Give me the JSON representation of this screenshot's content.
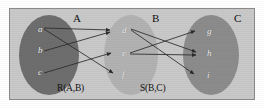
{
  "figure": {
    "background_color": "#ffffff",
    "panel_color": "#c9c9c9",
    "panel_border_color": "#8a8a8a",
    "edge_color": "#2b2b2b",
    "node_text_color": "#f2f2f2"
  },
  "sets": [
    {
      "id": "A",
      "label": "A",
      "fill": "#6e6e6e",
      "cx": 49,
      "cy": 55,
      "rx": 30,
      "ry": 40,
      "label_x": 73,
      "label_y": 12,
      "relation_label": "R(A,B)",
      "relation_label_x": 57,
      "relation_label_y": 83,
      "elements": [
        {
          "id": "a",
          "label": "a",
          "x": 38,
          "y": 29
        },
        {
          "id": "b",
          "label": "b",
          "x": 38,
          "y": 50
        },
        {
          "id": "c",
          "label": "c",
          "x": 38,
          "y": 72
        }
      ]
    },
    {
      "id": "B",
      "label": "B",
      "fill": "#b2b2b2",
      "cx": 131,
      "cy": 55,
      "rx": 27,
      "ry": 40,
      "label_x": 152,
      "label_y": 12,
      "relation_label": "S(B,C)",
      "relation_label_x": 140,
      "relation_label_y": 83,
      "elements": [
        {
          "id": "d",
          "label": "d",
          "x": 122,
          "y": 30
        },
        {
          "id": "e",
          "label": "e",
          "x": 122,
          "y": 53
        },
        {
          "id": "f",
          "label": "f",
          "x": 122,
          "y": 74
        }
      ]
    },
    {
      "id": "C",
      "label": "C",
      "fill": "#8c8c8c",
      "cx": 211,
      "cy": 55,
      "rx": 28,
      "ry": 40,
      "label_x": 234,
      "label_y": 12,
      "relation_label": "",
      "relation_label_x": 0,
      "relation_label_y": 0,
      "elements": [
        {
          "id": "g",
          "label": "g",
          "x": 207,
          "y": 31
        },
        {
          "id": "h",
          "label": "h",
          "x": 207,
          "y": 53
        },
        {
          "id": "i",
          "label": "i",
          "x": 207,
          "y": 75
        }
      ]
    }
  ],
  "edges": {
    "R": [
      {
        "from": "a",
        "to": "d",
        "x1": 44,
        "y1": 28,
        "x2": 110,
        "y2": 30
      },
      {
        "from": "a",
        "to": "f",
        "x1": 44,
        "y1": 29,
        "x2": 113,
        "y2": 73
      },
      {
        "from": "b",
        "to": "d",
        "x1": 44,
        "y1": 51,
        "x2": 110,
        "y2": 32
      },
      {
        "from": "c",
        "to": "e",
        "x1": 44,
        "y1": 73,
        "x2": 111,
        "y2": 53
      }
    ],
    "S": [
      {
        "from": "d",
        "to": "h",
        "x1": 131,
        "y1": 29,
        "x2": 196,
        "y2": 52
      },
      {
        "from": "d",
        "to": "i",
        "x1": 131,
        "y1": 30,
        "x2": 194,
        "y2": 74
      },
      {
        "from": "e",
        "to": "g",
        "x1": 130,
        "y1": 53,
        "x2": 195,
        "y2": 31
      },
      {
        "from": "e",
        "to": "h",
        "x1": 130,
        "y1": 54,
        "x2": 196,
        "y2": 55
      }
    ]
  }
}
